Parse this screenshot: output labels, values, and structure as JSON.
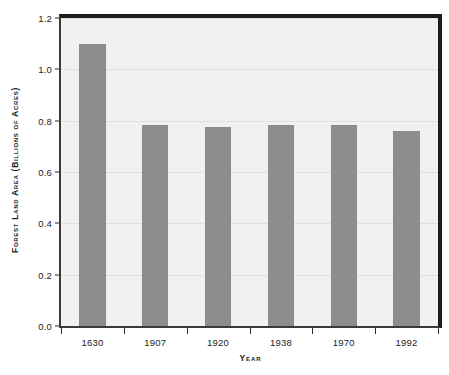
{
  "chart_data": {
    "type": "bar",
    "title": "",
    "xlabel": "Year",
    "ylabel": "Forest Land Area (Billions of Acres)",
    "categories": [
      "1630",
      "1907",
      "1920",
      "1938",
      "1970",
      "1992"
    ],
    "values": [
      1.1,
      0.785,
      0.775,
      0.785,
      0.785,
      0.76
    ],
    "series": [
      {
        "name": "Forest land area",
        "values": [
          1.1,
          0.785,
          0.775,
          0.785,
          0.785,
          0.76
        ]
      }
    ],
    "ylim": [
      0.0,
      1.2
    ],
    "ytick_labels": [
      "0.0",
      "0.2",
      "0.4",
      "0.6",
      "0.8",
      "1.0",
      "1.2"
    ],
    "ytick_values": [
      0.0,
      0.2,
      0.4,
      0.6,
      0.8,
      1.0,
      1.2
    ],
    "grid": true,
    "grid_axis": "y",
    "legend": false,
    "legend_position": "none",
    "bar_color": "#8d8d8d",
    "plot_background": "#f1f1f1",
    "frame_color": "#1d1d1d",
    "gridline_color": "#e0e0e0",
    "text_color": "#1b1b1b"
  }
}
